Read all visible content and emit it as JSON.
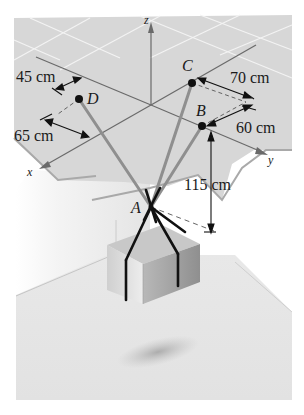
{
  "figure": {
    "axes": {
      "x": "x",
      "y": "y",
      "z": "z"
    },
    "points": {
      "A": {
        "label": "A"
      },
      "B": {
        "label": "B"
      },
      "C": {
        "label": "C"
      },
      "D": {
        "label": "D"
      }
    },
    "dimensions": {
      "d_45": "45 cm",
      "d_65": "65 cm",
      "d_70": "70 cm",
      "d_60": "60 cm",
      "d_115": "115 cm"
    },
    "colors": {
      "ceiling": "#d6d6d6",
      "ceiling_grid": "#f2f2f2",
      "floor": "#e6e6e6",
      "cable": "#8c8c8c",
      "rope": "#111111",
      "axis": "#666666",
      "crate_top": "#c9c9c9",
      "crate_front": "#e2e2e2",
      "crate_side": "#a6a6a6"
    }
  }
}
